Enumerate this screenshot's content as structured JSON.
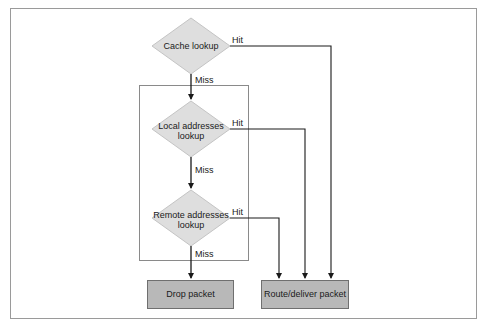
{
  "diagram": {
    "type": "flowchart",
    "colors": {
      "diamond_fill": "#dedede",
      "diamond_stroke": "#c4c4c4",
      "box_fill": "#b8b8b8",
      "box_stroke": "#6f6f6f",
      "line": "#1a1a1a",
      "frame": "#9a9a9a"
    },
    "nodes": {
      "cache": {
        "line1": "Cache lookup"
      },
      "local": {
        "line1": "Local addresses",
        "line2": "lookup"
      },
      "remote": {
        "line1": "Remote addresses",
        "line2": "lookup"
      },
      "drop": {
        "label": "Drop packet"
      },
      "route": {
        "label": "Route/deliver packet"
      }
    },
    "edges": {
      "cache_hit": "Hit",
      "cache_miss": "Miss",
      "local_hit": "Hit",
      "local_miss": "Miss",
      "remote_hit": "Hit",
      "remote_miss": "Miss"
    }
  }
}
